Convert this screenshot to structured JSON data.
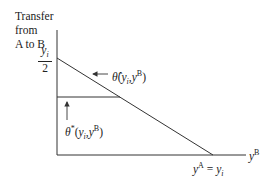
{
  "diagram": {
    "yaxis_label_lines": [
      "Transfer",
      "from",
      "A to B"
    ],
    "yaxis_tick": {
      "numerator": "y",
      "numerator_sub": "i",
      "denominator": "2"
    },
    "xaxis_label": {
      "base": "y",
      "sup": "B"
    },
    "xaxis_tick": {
      "lhs": "y",
      "lhs_sup": "A",
      "eq": " = ",
      "rhs": "y",
      "rhs_sub": "i"
    },
    "curve_hat_label": {
      "symbol": "θ̂",
      "args_open": "(",
      "arg1": "y",
      "arg1_sub": "i",
      "comma": ",",
      "arg2": "y",
      "arg2_sup": "B",
      "args_close": ")"
    },
    "curve_star_label": {
      "symbol": "θ",
      "symbol_sup": "*",
      "args_open": "(",
      "arg1": "y",
      "arg1_sub": "i",
      "comma": ",",
      "arg2": "y",
      "arg2_sup": "B",
      "args_close": ")"
    },
    "line_color": "#333333"
  }
}
